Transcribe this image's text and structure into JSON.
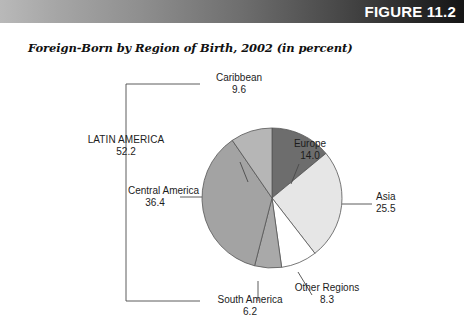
{
  "figure": {
    "band_label": "FIGURE 11.2",
    "band_color_dark": "#151515",
    "band_color_light": "#b9b9b9"
  },
  "chart_data": {
    "type": "pie",
    "title": "Foreign-Born by Region of Birth, 2002 (in percent)",
    "unit": "percent",
    "start_angle_deg": 0,
    "direction": "clockwise",
    "categories": [
      "Europe",
      "Asia",
      "Other Regions",
      "South America",
      "Central America",
      "Caribbean"
    ],
    "values": [
      14.0,
      25.5,
      8.3,
      6.2,
      36.4,
      9.6
    ],
    "slices": [
      {
        "label": "Europe",
        "value": 14.0,
        "value_text": "14.0",
        "color": "#6d6d6d",
        "label_pos": "top-right"
      },
      {
        "label": "Asia",
        "value": 25.5,
        "value_text": "25.5",
        "color": "#e6e6e6",
        "label_pos": "right"
      },
      {
        "label": "Other Regions",
        "value": 8.3,
        "value_text": "8.3",
        "color": "#ffffff",
        "label_pos": "bottom-right"
      },
      {
        "label": "South America",
        "value": 6.2,
        "value_text": "6.2",
        "color": "#a9a9a9",
        "label_pos": "bottom"
      },
      {
        "label": "Central America",
        "value": 36.4,
        "value_text": "36.4",
        "color": "#a3a3a3",
        "label_pos": "left"
      },
      {
        "label": "Caribbean",
        "value": 9.6,
        "value_text": "9.6",
        "color": "#b6b6b6",
        "label_pos": "top-left"
      }
    ],
    "group": {
      "label": "LATIN AMERICA",
      "value": 52.2,
      "value_text": "52.2",
      "members": [
        "Caribbean",
        "Central America",
        "South America"
      ],
      "bracket": "left-brace"
    },
    "legend": "none",
    "grid": false
  }
}
